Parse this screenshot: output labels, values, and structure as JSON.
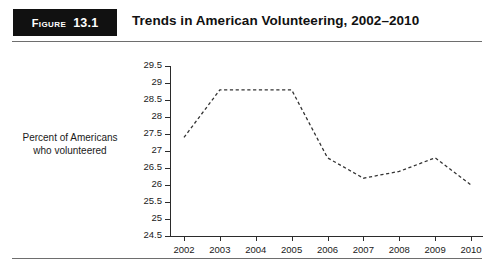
{
  "header": {
    "badge_word": "Figure",
    "badge_number": "13.1",
    "title": "Trends in American Volunteering, 2002–2010"
  },
  "chart_data": {
    "type": "line",
    "title": "Trends in American Volunteering, 2002–2010",
    "xlabel": "",
    "ylabel": "Percent of Americans who volunteered",
    "categories": [
      "2002",
      "2003",
      "2004",
      "2005",
      "2006",
      "2007",
      "2008",
      "2009",
      "2010"
    ],
    "x": [
      2002,
      2003,
      2004,
      2005,
      2006,
      2007,
      2008,
      2009,
      2010
    ],
    "values": [
      27.4,
      28.8,
      28.8,
      28.8,
      26.8,
      26.2,
      26.4,
      26.8,
      26.0
    ],
    "series": [
      {
        "name": "Percent of Americans who volunteered",
        "values": [
          27.4,
          28.8,
          28.8,
          28.8,
          26.8,
          26.2,
          26.4,
          26.8,
          26.0
        ],
        "line_style": "dashed",
        "color": "#333333",
        "markers": false
      }
    ],
    "ylim": [
      24.5,
      29.5
    ],
    "yticks": [
      "29.5",
      "29",
      "28.5",
      "28",
      "27.5",
      "27",
      "26.5",
      "26",
      "25.5",
      "25",
      "24.5"
    ],
    "ytick_values": [
      29.5,
      29,
      28.5,
      28,
      27.5,
      27,
      26.5,
      26,
      25.5,
      25,
      24.5
    ],
    "xticks": [
      "2002",
      "2003",
      "2004",
      "2005",
      "2006",
      "2007",
      "2008",
      "2009",
      "2010"
    ],
    "grid": false,
    "legend": false,
    "legend_position": "none"
  },
  "colors": {
    "badge_background": "#111111",
    "badge_text": "#ffffff",
    "title_text": "#111111",
    "rule": "#6e6e6e",
    "axis": "#2b2b2b",
    "series_line": "#333333",
    "page_background": "#ffffff"
  }
}
